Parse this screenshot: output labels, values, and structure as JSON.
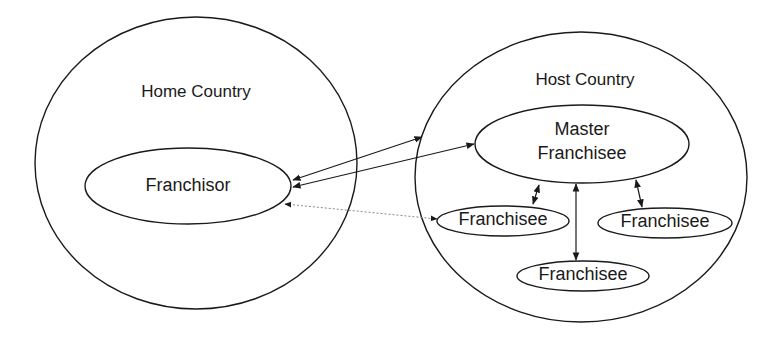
{
  "diagram": {
    "home_country": {
      "label": "Home Country"
    },
    "franchisor": {
      "label": "Franchisor"
    },
    "host_country": {
      "label": "Host Country"
    },
    "master_franchisee": {
      "line1": "Master",
      "line2": "Franchisee"
    },
    "franchisees": [
      {
        "label": "Franchisee"
      },
      {
        "label": "Franchisee"
      },
      {
        "label": "Franchisee"
      }
    ],
    "colors": {
      "stroke": "#1a1a1a",
      "dotted": "#888888",
      "background": "#ffffff"
    }
  }
}
